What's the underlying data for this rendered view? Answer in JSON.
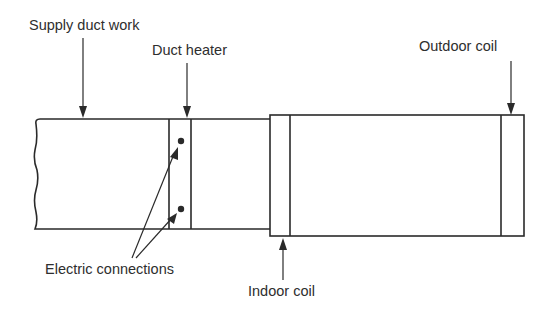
{
  "labels": {
    "supply_duct_work": "Supply duct work",
    "duct_heater": "Duct heater",
    "outdoor_coil": "Outdoor coil",
    "electric_connections": "Electric connections",
    "indoor_coil": "Indoor coil"
  },
  "colors": {
    "line": "#2a2a2a",
    "background": "#ffffff"
  }
}
